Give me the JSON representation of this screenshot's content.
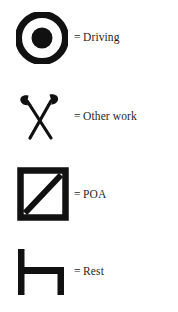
{
  "legend": {
    "title": "Duty Status Legend",
    "background_color": "#ffffff",
    "ink_color": "#111111",
    "text_color": "#1f1f1f",
    "equals_sign": "=",
    "items": [
      {
        "icon": "bullseye-icon",
        "icon_description": "thick black ring with solid black center dot",
        "equals": "=",
        "label": "Driving"
      },
      {
        "icon": "crossed-mallets-icon",
        "icon_description": "two mallets with bulbous heads crossed in an X",
        "equals": "=",
        "label": "Other work"
      },
      {
        "icon": "square-diagonal-icon",
        "icon_description": "thick outlined square with diagonal stroke from bottom-left to top-right",
        "equals": "=",
        "label": "POA"
      },
      {
        "icon": "bed-icon",
        "icon_description": "bed profile: tall left post, horizontal top bar, short right post",
        "equals": "=",
        "label": "Rest"
      }
    ]
  }
}
